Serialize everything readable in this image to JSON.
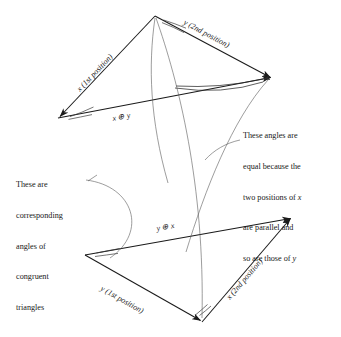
{
  "figure": {
    "stroke_color": "#1a1a1a",
    "thin_stroke_color": "#4a4a4a",
    "background": "#ffffff"
  },
  "labels": {
    "x_first_position": "x (1st position)",
    "y_second_position": "y (2nd position)",
    "x_plus_y": "x ⊕ y",
    "y_plus_x": "y ⊕ x",
    "y_first_position": "y (1st position)",
    "x_second_position": "x (2nd position)"
  },
  "annotations": {
    "left": {
      "lines": [
        "These are",
        "corresponding",
        "angles of",
        "congruent",
        "triangles"
      ],
      "text": "These are\ncorresponding\nangles of\ncongruent\ntriangles"
    },
    "right": {
      "lines": [
        "These angles are",
        "equal because the",
        "two positions of x",
        "are parallel and",
        "so are those of y"
      ],
      "line1": "These angles are",
      "line2": "equal because the",
      "line3a": "two positions of ",
      "line3b": "x",
      "line4": "are parallel and",
      "line5a": "so are those of ",
      "line5b": "y"
    }
  },
  "geometry": {
    "top_triangle": {
      "apex": [
        155,
        16
      ],
      "left": [
        58,
        118
      ],
      "right": [
        272,
        78
      ]
    },
    "bottom_triangle": {
      "left": [
        85,
        255
      ],
      "bottom": [
        202,
        322
      ],
      "right": [
        292,
        217
      ]
    }
  }
}
